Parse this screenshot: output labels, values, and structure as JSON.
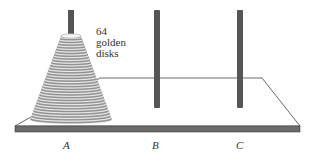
{
  "diagram": {
    "annotation": [
      "64",
      "golden",
      "disks"
    ],
    "disk_count": 64,
    "pegs": [
      {
        "label": "A",
        "has_disks": true
      },
      {
        "label": "B",
        "has_disks": false
      },
      {
        "label": "C",
        "has_disks": false
      }
    ],
    "colors": {
      "peg": "#555555",
      "disk": "#9a9a9a",
      "board_edge": "#444444",
      "board_front": "#6a6a6a"
    }
  }
}
